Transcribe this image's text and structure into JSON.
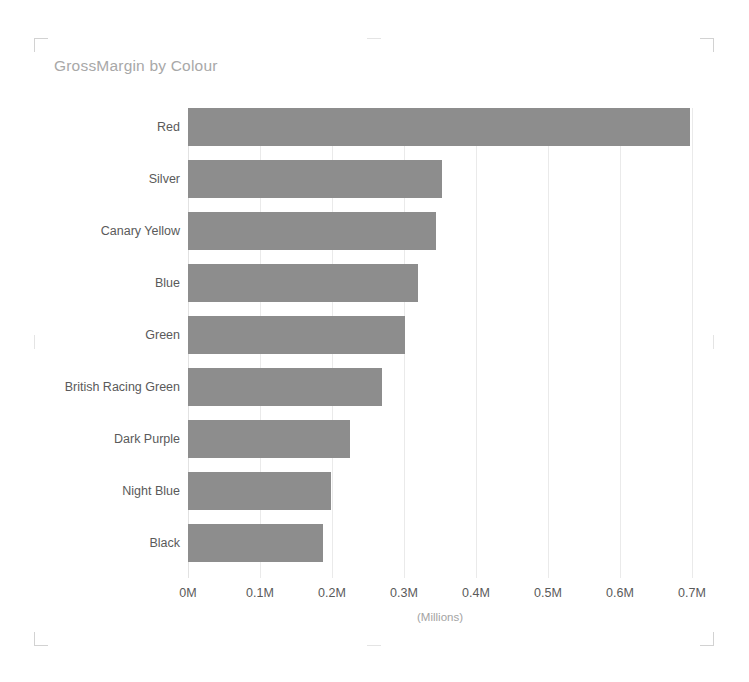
{
  "visual": {
    "title": "GrossMargin by Colour",
    "background_color": "#ffffff",
    "title_color": "#a8a8a8",
    "bar_color": "#8d8d8d",
    "gridline_color": "#eaeaea",
    "label_color": "#5a5a5a",
    "selection_handles": [
      "top-left",
      "top-right",
      "bottom-left",
      "bottom-right",
      "top-center",
      "bottom-center",
      "left-center",
      "right-center"
    ]
  },
  "chart_data": {
    "type": "bar",
    "orientation": "horizontal",
    "title": "GrossMargin by Colour",
    "xlabel": "(Millions)",
    "ylabel": "",
    "categories": [
      "Red",
      "Silver",
      "Canary Yellow",
      "Blue",
      "Green",
      "British Racing Green",
      "Dark Purple",
      "Night Blue",
      "Black"
    ],
    "values": [
      0.697,
      0.353,
      0.344,
      0.319,
      0.301,
      0.269,
      0.225,
      0.199,
      0.188
    ],
    "value_unit": "Millions",
    "series": [
      {
        "name": "GrossMargin",
        "values": [
          0.697,
          0.353,
          0.344,
          0.319,
          0.301,
          0.269,
          0.225,
          0.199,
          0.188
        ]
      }
    ],
    "xlim": [
      0,
      0.7
    ],
    "x_ticks": [
      0,
      0.1,
      0.2,
      0.3,
      0.4,
      0.5,
      0.6,
      0.7
    ],
    "x_tick_labels": [
      "0M",
      "0.1M",
      "0.2M",
      "0.3M",
      "0.4M",
      "0.5M",
      "0.6M",
      "0.7M"
    ],
    "grid": true,
    "grid_axis": "x",
    "legend": false,
    "legend_position": "none",
    "sorted": "descending"
  }
}
